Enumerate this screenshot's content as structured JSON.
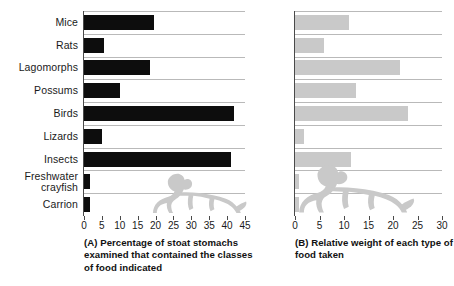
{
  "figure": {
    "panels": [
      "A",
      "B"
    ],
    "colors": {
      "bar_dark": "#0d0d0d",
      "bar_light": "#c9c9c9",
      "gridline": "#b9b9b9",
      "axis": "#4a4a4a",
      "silhouette": "#c9c9c9",
      "background": "#ffffff"
    },
    "silhouette_name": "stoat-silhouette"
  },
  "panel_a": {
    "caption": "(A) Percentage of stoat stomachs examined that contained the classes of food indicated"
  },
  "panel_b": {
    "caption": "(B) Relative weight of each type of food taken"
  },
  "chart_data": [
    {
      "type": "bar",
      "orientation": "horizontal",
      "panel": "A",
      "title": "(A) Percentage of stoat stomachs examined that contained the classes of food indicated",
      "xlabel": "",
      "ylabel": "",
      "xlim": [
        0,
        45
      ],
      "xticks": [
        0,
        5,
        10,
        15,
        20,
        25,
        30,
        35,
        40,
        45
      ],
      "xticklabels": [
        "0",
        "5",
        "10",
        "15",
        "20",
        "25",
        "30",
        "35",
        "40",
        "45"
      ],
      "grid": false,
      "legend": "none",
      "bar_color": "#0d0d0d",
      "categories": [
        "Mice",
        "Rats",
        "Lagomorphs",
        "Possums",
        "Birds",
        "Lizards",
        "Insects",
        "Freshwater\ncrayfish",
        "Carrion"
      ],
      "values": [
        19.5,
        5.5,
        18.5,
        10.0,
        42.0,
        5.0,
        41.0,
        1.8,
        1.8
      ]
    },
    {
      "type": "bar",
      "orientation": "horizontal",
      "panel": "B",
      "title": "(B) Relative weight of each type of food taken",
      "xlabel": "",
      "ylabel": "",
      "xlim": [
        0,
        30
      ],
      "xticks": [
        0,
        5,
        10,
        15,
        20,
        25,
        30
      ],
      "xticklabels": [
        "0",
        "5",
        "10",
        "15",
        "20",
        "25",
        "30"
      ],
      "grid": false,
      "legend": "none",
      "bar_color": "#c9c9c9",
      "categories": [
        "Mice",
        "Rats",
        "Lagomorphs",
        "Possums",
        "Birds",
        "Lizards",
        "Insects",
        "Freshwater\ncrayfish",
        "Carrion"
      ],
      "values": [
        11.0,
        6.0,
        21.5,
        12.5,
        23.0,
        1.8,
        11.5,
        0.8,
        0.8
      ]
    }
  ]
}
